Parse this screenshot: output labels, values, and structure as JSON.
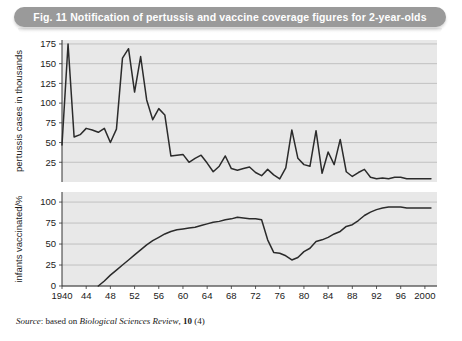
{
  "figure": {
    "title": "Fig. 11  Notification of pertussis and vaccine coverage figures for 2-year-olds",
    "source_prefix": "Source",
    "source_mid": ": based on ",
    "source_journal": "Biological Sciences Review",
    "source_comma": ", ",
    "source_volume": "10",
    "source_issue": " (4)",
    "banner_color": "#9a9a9a",
    "plot_bg_color": "#e8e8e8",
    "grid_color": "#b0b0b0",
    "line_color": "#2b2b2b"
  },
  "chart_data": [
    {
      "type": "line",
      "title": "Notification of pertussis",
      "panel": "top",
      "xlabel": "year",
      "ylabel": "pertussis cases in thousands",
      "xlim": [
        1940,
        2002
      ],
      "ylim": [
        0,
        180
      ],
      "yticks": [
        25,
        50,
        75,
        100,
        125,
        150,
        175
      ],
      "ytick_labels": [
        "25",
        "50",
        "75",
        "100",
        "125",
        "150",
        "175"
      ],
      "xticks": [
        1940,
        1944,
        1948,
        1952,
        1956,
        1960,
        1964,
        1968,
        1972,
        1976,
        1980,
        1984,
        1988,
        1992,
        1996,
        2000
      ],
      "xtick_labels": [
        "1940",
        "44",
        "48",
        "52",
        "56",
        "60",
        "64",
        "68",
        "72",
        "76",
        "80",
        "84",
        "88",
        "92",
        "96",
        "2000"
      ],
      "grid": true,
      "legend": "none",
      "x": [
        1940,
        1941,
        1942,
        1943,
        1944,
        1945,
        1946,
        1947,
        1948,
        1949,
        1950,
        1951,
        1952,
        1953,
        1954,
        1955,
        1956,
        1957,
        1958,
        1959,
        1960,
        1961,
        1962,
        1963,
        1964,
        1965,
        1966,
        1967,
        1968,
        1969,
        1970,
        1971,
        1972,
        1973,
        1974,
        1975,
        1976,
        1977,
        1978,
        1979,
        1980,
        1981,
        1982,
        1983,
        1984,
        1985,
        1986,
        1987,
        1988,
        1989,
        1990,
        1991,
        1992,
        1993,
        1994,
        1995,
        1996,
        1997,
        1998,
        1999,
        2000,
        2001
      ],
      "values": [
        47,
        175,
        57,
        60,
        68,
        66,
        63,
        68,
        50,
        67,
        157,
        169,
        114,
        159,
        104,
        79,
        93,
        85,
        33,
        34,
        35,
        25,
        30,
        34,
        24,
        13,
        20,
        33,
        17,
        15,
        17,
        19,
        12,
        8,
        16,
        9,
        4,
        18,
        66,
        30,
        22,
        20,
        65,
        11,
        38,
        22,
        54,
        13,
        7,
        12,
        16,
        6,
        4,
        5,
        4,
        6,
        6,
        4,
        4,
        4,
        4,
        4
      ]
    },
    {
      "type": "line",
      "title": "Vaccine coverage",
      "panel": "bottom",
      "xlabel": "year",
      "ylabel": "infants vaccinated/%",
      "xlim": [
        1940,
        2002
      ],
      "ylim": [
        0,
        112
      ],
      "yticks": [
        0,
        25,
        50,
        75,
        100
      ],
      "ytick_labels": [
        "0",
        "25",
        "50",
        "75",
        "100"
      ],
      "xticks": [
        1940,
        1944,
        1948,
        1952,
        1956,
        1960,
        1964,
        1968,
        1972,
        1976,
        1980,
        1984,
        1988,
        1992,
        1996,
        2000
      ],
      "xtick_labels": [
        "1940",
        "44",
        "48",
        "52",
        "56",
        "60",
        "64",
        "68",
        "72",
        "76",
        "80",
        "84",
        "88",
        "92",
        "96",
        "2000"
      ],
      "grid": true,
      "legend": "none",
      "x": [
        1946,
        1947,
        1948,
        1949,
        1950,
        1951,
        1952,
        1953,
        1954,
        1955,
        1956,
        1957,
        1958,
        1959,
        1960,
        1961,
        1962,
        1963,
        1964,
        1965,
        1966,
        1967,
        1968,
        1969,
        1970,
        1971,
        1972,
        1973,
        1974,
        1975,
        1976,
        1977,
        1978,
        1979,
        1980,
        1981,
        1982,
        1983,
        1984,
        1985,
        1986,
        1987,
        1988,
        1989,
        1990,
        1991,
        1992,
        1993,
        1994,
        1995,
        1996,
        1997,
        1998,
        1999,
        2000,
        2001
      ],
      "values": [
        0,
        6,
        13,
        19,
        25,
        31,
        37,
        43,
        49,
        54,
        58,
        62,
        65,
        67,
        68,
        69,
        70,
        72,
        74,
        76,
        77,
        79,
        80,
        82,
        81,
        80,
        80,
        79,
        55,
        40,
        39,
        36,
        31,
        34,
        41,
        45,
        53,
        55,
        58,
        62,
        65,
        71,
        73,
        78,
        84,
        88,
        91,
        93,
        94,
        94,
        94,
        93,
        93,
        93,
        93,
        93
      ]
    }
  ]
}
